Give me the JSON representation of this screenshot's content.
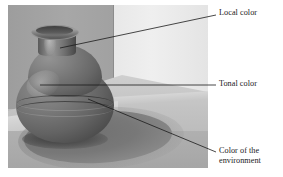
{
  "figure": {
    "type": "annotated-photograph-diagram",
    "width": 283,
    "height": 177,
    "background_color": "#ffffff"
  },
  "photo": {
    "alt": "grayscale photograph of a dark rounded ceramic vase standing on a light table against a two-tone corner wall, casting a long soft shadow to the right",
    "colors": {
      "wall_left": "#a2a2a2",
      "wall_right": "#eaeaea",
      "table_top": "#c6c6c6",
      "table_front": "#ababab",
      "vase_light": "#909090",
      "vase_dark": "#3c3c3c",
      "shadow": "#777777"
    }
  },
  "annotations": [
    {
      "id": "local-color",
      "label": "Local color",
      "target": "vase neck / mid-tone body surface",
      "leader": {
        "x1": 60,
        "y1": 48,
        "x2": 216,
        "y2": 15
      }
    },
    {
      "id": "tonal-color",
      "label": "Tonal color",
      "target": "lit belly of the vase",
      "leader": {
        "x1": 40,
        "y1": 85,
        "x2": 216,
        "y2": 85
      }
    },
    {
      "id": "color-of-the-environment",
      "label": "Color of the\nenvironment",
      "target": "cast shadow on the table",
      "leader": {
        "x1": 88,
        "y1": 99,
        "x2": 216,
        "y2": 152
      }
    }
  ],
  "leader_style": {
    "stroke": "#1a1a1a",
    "stroke_width": 0.8
  }
}
